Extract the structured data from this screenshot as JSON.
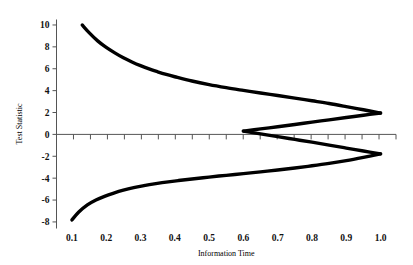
{
  "figure": {
    "title": "",
    "background_color": "#ffffff",
    "curve_color": "#000000",
    "axis_color": "#555555"
  },
  "chart_data": {
    "type": "line",
    "title": "",
    "subtitle": "",
    "xlabel": "Information Time",
    "ylabel": "Test Statistic",
    "xlim": [
      0.055,
      1.045
    ],
    "ylim": [
      -8.6,
      10.5
    ],
    "grid": false,
    "legend": null,
    "legend_position": "none",
    "xticks": [
      0.1,
      0.2,
      0.3,
      0.4,
      0.5,
      0.6,
      0.7,
      0.8,
      0.9,
      1.0
    ],
    "xtick_labels": [
      "0.1",
      "0.2",
      "0.3",
      "0.4",
      "0.5",
      "0.6",
      "0.7",
      "0.8",
      "0.9",
      "1.0"
    ],
    "yticks": [
      -8,
      -6,
      -4,
      -2,
      0,
      2,
      4,
      6,
      8,
      10
    ],
    "ytick_labels": [
      "-8",
      "-6",
      "-4",
      "-2",
      "0",
      "2",
      "4",
      "6",
      "8",
      "10"
    ],
    "x_minor_tick_count": 20,
    "zero_line": 0,
    "series": [
      {
        "name": "upper-efficacy-boundary",
        "x": [
          0.13,
          0.15,
          0.175,
          0.2,
          0.225,
          0.25,
          0.275,
          0.3,
          0.325,
          0.35,
          0.375,
          0.4,
          0.45,
          0.5,
          0.55,
          0.6,
          0.65,
          0.7,
          0.75,
          0.8,
          0.85,
          0.9,
          0.95,
          1.0
        ],
        "values": [
          10.0,
          9.3,
          8.55,
          7.95,
          7.45,
          7.0,
          6.62,
          6.28,
          5.98,
          5.72,
          5.48,
          5.27,
          4.88,
          4.55,
          4.27,
          4.02,
          3.78,
          3.55,
          3.32,
          3.07,
          2.82,
          2.54,
          2.25,
          1.95
        ]
      },
      {
        "name": "lower-efficacy-boundary",
        "x": [
          0.1,
          0.12,
          0.145,
          0.17,
          0.195,
          0.22,
          0.25,
          0.28,
          0.31,
          0.34,
          0.375,
          0.41,
          0.45,
          0.5,
          0.55,
          0.6,
          0.65,
          0.7,
          0.75,
          0.8,
          0.85,
          0.9,
          0.95,
          1.0
        ],
        "values": [
          -7.82,
          -7.1,
          -6.45,
          -6.0,
          -5.66,
          -5.38,
          -5.09,
          -4.86,
          -4.68,
          -4.52,
          -4.36,
          -4.22,
          -4.08,
          -3.9,
          -3.74,
          -3.58,
          -3.42,
          -3.25,
          -3.07,
          -2.87,
          -2.65,
          -2.4,
          -2.1,
          -1.78
        ]
      },
      {
        "name": "upper-futility-boundary",
        "x": [
          0.6,
          0.65,
          0.7,
          0.75,
          0.8,
          0.85,
          0.9,
          0.95,
          1.0
        ],
        "values": [
          0.3,
          0.5,
          0.7,
          0.9,
          1.12,
          1.33,
          1.54,
          1.75,
          1.95
        ]
      },
      {
        "name": "lower-futility-boundary",
        "x": [
          0.6,
          0.65,
          0.7,
          0.75,
          0.8,
          0.85,
          0.9,
          0.95,
          1.0
        ],
        "values": [
          0.3,
          0.05,
          -0.2,
          -0.46,
          -0.71,
          -0.98,
          -1.25,
          -1.52,
          -1.78
        ]
      }
    ]
  }
}
